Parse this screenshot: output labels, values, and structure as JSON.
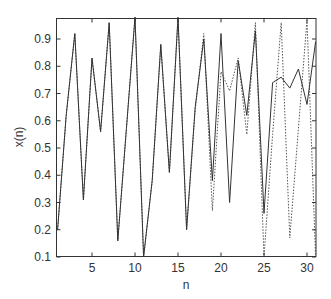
{
  "chart_data": {
    "type": "line",
    "title": "",
    "xlabel": "n",
    "ylabel": "x(n)",
    "xlim": [
      1,
      31
    ],
    "ylim": [
      0.1,
      0.98
    ],
    "xticks": [
      5,
      10,
      15,
      20,
      25,
      30
    ],
    "yticks": [
      0.1,
      0.2,
      0.3,
      0.4,
      0.5,
      0.6,
      0.7,
      0.8,
      0.9
    ],
    "grid": false,
    "legend": null,
    "x": [
      1,
      2,
      3,
      4,
      5,
      6,
      7,
      8,
      9,
      10,
      11,
      12,
      13,
      14,
      15,
      16,
      17,
      18,
      19,
      20,
      21,
      22,
      23,
      24,
      25,
      26,
      27,
      28,
      29,
      30,
      31
    ],
    "series": [
      {
        "name": "solid",
        "style": "solid",
        "color": "#333333",
        "values": [
          0.2,
          0.62,
          0.92,
          0.31,
          0.83,
          0.56,
          0.96,
          0.16,
          0.57,
          0.98,
          0.1,
          0.38,
          0.88,
          0.41,
          0.98,
          0.2,
          0.65,
          0.9,
          0.38,
          0.92,
          0.3,
          0.82,
          0.62,
          0.93,
          0.26,
          0.74,
          0.76,
          0.72,
          0.79,
          0.66,
          0.89
        ]
      },
      {
        "name": "dotted",
        "style": "dotted",
        "color": "#555555",
        "values": [
          0.2,
          0.62,
          0.92,
          0.31,
          0.83,
          0.56,
          0.96,
          0.16,
          0.57,
          0.98,
          0.1,
          0.38,
          0.88,
          0.41,
          0.98,
          0.2,
          0.64,
          0.92,
          0.27,
          0.78,
          0.71,
          0.83,
          0.55,
          0.96,
          0.1,
          0.55,
          0.96,
          0.17,
          0.57,
          0.97,
          0.1
        ]
      }
    ]
  }
}
